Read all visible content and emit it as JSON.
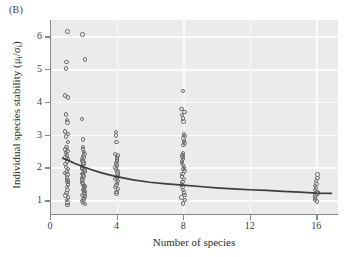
{
  "panel": {
    "label": "(B)"
  },
  "chart_data": {
    "type": "scatter",
    "title": "",
    "panel_label": "(B)",
    "xlabel": "Number of species",
    "ylabel": "Individual species stability (μᵢ/σᵢ)",
    "ylabel_parts": {
      "text": "Individual species stability (",
      "mu": "μ",
      "mu_sub": "i",
      "slash": "/",
      "sigma": "σ",
      "sigma_sub": "i",
      "close": ")"
    },
    "xlim": [
      0,
      17.3
    ],
    "ylim": [
      0.55,
      6.5
    ],
    "xticks": [
      0,
      4,
      8,
      12,
      16
    ],
    "xticklabels": [
      "0",
      "4",
      "8",
      "12",
      "16"
    ],
    "yticks": [
      1,
      2,
      3,
      4,
      5,
      6
    ],
    "yticklabels": [
      "1",
      "2",
      "3",
      "4",
      "5",
      "6"
    ],
    "grid": true,
    "grid_color": "#fbfbfb",
    "plot_background": "#ebebeb",
    "marker": "open-circle",
    "marker_color": "#6e6e6e",
    "legend": null,
    "series": [
      {
        "name": "Individual species stability",
        "points": [
          [
            1,
            6.15
          ],
          [
            1,
            5.22
          ],
          [
            1,
            5.02
          ],
          [
            1,
            4.2
          ],
          [
            1,
            4.13
          ],
          [
            1,
            3.62
          ],
          [
            1,
            3.44
          ],
          [
            1,
            3.37
          ],
          [
            1,
            3.1
          ],
          [
            1,
            3.02
          ],
          [
            1,
            2.94
          ],
          [
            1,
            2.78
          ],
          [
            1,
            2.62
          ],
          [
            1,
            2.55
          ],
          [
            1,
            2.5
          ],
          [
            1,
            2.44
          ],
          [
            1,
            2.37
          ],
          [
            1,
            2.3
          ],
          [
            1,
            2.25
          ],
          [
            1,
            2.18
          ],
          [
            1,
            2.1
          ],
          [
            1,
            2.02
          ],
          [
            1,
            1.95
          ],
          [
            1,
            1.88
          ],
          [
            1,
            1.83
          ],
          [
            1,
            1.78
          ],
          [
            1,
            1.7
          ],
          [
            1,
            1.62
          ],
          [
            1,
            1.55
          ],
          [
            1,
            1.48
          ],
          [
            1,
            1.4
          ],
          [
            1,
            1.32
          ],
          [
            1,
            1.22
          ],
          [
            1,
            1.15
          ],
          [
            1,
            1.08
          ],
          [
            1,
            1.0
          ],
          [
            1,
            0.93
          ],
          [
            1,
            0.86
          ],
          [
            2,
            6.06
          ],
          [
            2,
            5.3
          ],
          [
            2,
            3.48
          ],
          [
            2,
            2.85
          ],
          [
            2,
            2.62
          ],
          [
            2,
            2.55
          ],
          [
            2,
            2.48
          ],
          [
            2,
            2.42
          ],
          [
            2,
            2.35
          ],
          [
            2,
            2.3
          ],
          [
            2,
            2.25
          ],
          [
            2,
            2.2
          ],
          [
            2,
            2.15
          ],
          [
            2,
            2.1
          ],
          [
            2,
            2.05
          ],
          [
            2,
            2.0
          ],
          [
            2,
            1.96
          ],
          [
            2,
            1.92
          ],
          [
            2,
            1.88
          ],
          [
            2,
            1.84
          ],
          [
            2,
            1.8
          ],
          [
            2,
            1.76
          ],
          [
            2,
            1.72
          ],
          [
            2,
            1.68
          ],
          [
            2,
            1.63
          ],
          [
            2,
            1.58
          ],
          [
            2,
            1.53
          ],
          [
            2,
            1.48
          ],
          [
            2,
            1.44
          ],
          [
            2,
            1.4
          ],
          [
            2,
            1.36
          ],
          [
            2,
            1.32
          ],
          [
            2,
            1.28
          ],
          [
            2,
            1.24
          ],
          [
            2,
            1.2
          ],
          [
            2,
            1.16
          ],
          [
            2,
            1.12
          ],
          [
            2,
            1.07
          ],
          [
            2,
            1.02
          ],
          [
            2,
            0.97
          ],
          [
            2,
            0.92
          ],
          [
            2,
            0.88
          ],
          [
            4,
            3.08
          ],
          [
            4,
            2.98
          ],
          [
            4,
            2.78
          ],
          [
            4,
            2.42
          ],
          [
            4,
            2.36
          ],
          [
            4,
            2.3
          ],
          [
            4,
            2.24
          ],
          [
            4,
            2.18
          ],
          [
            4,
            2.12
          ],
          [
            4,
            2.06
          ],
          [
            4,
            2.0
          ],
          [
            4,
            1.94
          ],
          [
            4,
            1.88
          ],
          [
            4,
            1.82
          ],
          [
            4,
            1.76
          ],
          [
            4,
            1.7
          ],
          [
            4,
            1.64
          ],
          [
            4,
            1.58
          ],
          [
            4,
            1.52
          ],
          [
            4,
            1.46
          ],
          [
            4,
            1.4
          ],
          [
            4,
            1.34
          ],
          [
            4,
            1.26
          ],
          [
            4,
            1.2
          ],
          [
            8,
            4.33
          ],
          [
            8,
            3.78
          ],
          [
            8,
            3.7
          ],
          [
            8,
            3.6
          ],
          [
            8,
            3.5
          ],
          [
            8,
            3.4
          ],
          [
            8,
            3.02
          ],
          [
            8,
            2.96
          ],
          [
            8,
            2.88
          ],
          [
            8,
            2.8
          ],
          [
            8,
            2.74
          ],
          [
            8,
            2.68
          ],
          [
            8,
            2.45
          ],
          [
            8,
            2.38
          ],
          [
            8,
            2.32
          ],
          [
            8,
            2.26
          ],
          [
            8,
            2.2
          ],
          [
            8,
            2.14
          ],
          [
            8,
            2.08
          ],
          [
            8,
            2.02
          ],
          [
            8,
            1.96
          ],
          [
            8,
            1.9
          ],
          [
            8,
            1.8
          ],
          [
            8,
            1.72
          ],
          [
            8,
            1.64
          ],
          [
            8,
            1.56
          ],
          [
            8,
            1.48
          ],
          [
            8,
            1.4
          ],
          [
            8,
            1.32
          ],
          [
            8,
            1.24
          ],
          [
            8,
            1.16
          ],
          [
            8,
            1.08
          ],
          [
            8,
            1.0
          ],
          [
            8,
            0.9
          ],
          [
            16,
            1.78
          ],
          [
            16,
            1.68
          ],
          [
            16,
            1.58
          ],
          [
            16,
            1.5
          ],
          [
            16,
            1.44
          ],
          [
            16,
            1.38
          ],
          [
            16,
            1.32
          ],
          [
            16,
            1.26
          ],
          [
            16,
            1.2
          ],
          [
            16,
            1.14
          ],
          [
            16,
            1.08
          ],
          [
            16,
            1.02
          ],
          [
            16,
            0.96
          ]
        ]
      }
    ],
    "fit_curve": {
      "name": "fitted trend",
      "color": "#3d3d3d",
      "points": [
        [
          0.75,
          2.28
        ],
        [
          1.0,
          2.24
        ],
        [
          1.5,
          2.12
        ],
        [
          2.0,
          2.02
        ],
        [
          2.5,
          1.93
        ],
        [
          3.0,
          1.85
        ],
        [
          3.5,
          1.78
        ],
        [
          4.0,
          1.72
        ],
        [
          5.0,
          1.62
        ],
        [
          6.0,
          1.55
        ],
        [
          7.0,
          1.5
        ],
        [
          8.0,
          1.46
        ],
        [
          9.0,
          1.42
        ],
        [
          10.0,
          1.38
        ],
        [
          11.0,
          1.35
        ],
        [
          12.0,
          1.32
        ],
        [
          13.0,
          1.3
        ],
        [
          14.0,
          1.27
        ],
        [
          15.0,
          1.25
        ],
        [
          16.0,
          1.22
        ],
        [
          16.9,
          1.21
        ]
      ]
    }
  }
}
